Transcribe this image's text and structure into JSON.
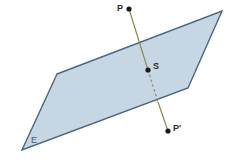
{
  "figure": {
    "width": 230,
    "height": 165,
    "background": "#ffffff"
  },
  "colors": {
    "plane_fill": "#c6d7e3",
    "plane_stroke": "#4a6680",
    "line_stroke": "#8a8a55",
    "point_fill": "#1a1a1a",
    "label_text": "#2b2b2b",
    "plane_label_text": "#4a5a68"
  },
  "plane": {
    "name": "E",
    "label": "E",
    "label_x": 31,
    "label_y": 136,
    "vertices": [
      {
        "x": 57,
        "y": 74
      },
      {
        "x": 222,
        "y": 11
      },
      {
        "x": 188,
        "y": 88
      },
      {
        "x": 22,
        "y": 150
      }
    ],
    "fill": "#c6d7e3",
    "stroke": "#4a6680",
    "stroke_width": 1.4
  },
  "points": [
    {
      "id": "P",
      "label": "P",
      "x": 129,
      "y": 9,
      "radius": 2.6,
      "label_x": 117,
      "label_y": 4,
      "label_position": "left"
    },
    {
      "id": "S",
      "label": "S",
      "x": 148,
      "y": 70,
      "radius": 2.6,
      "label_x": 153,
      "label_y": 62,
      "label_position": "right"
    },
    {
      "id": "P-prime",
      "label": "P'",
      "x": 168,
      "y": 131,
      "radius": 2.6,
      "label_x": 173,
      "label_y": 124,
      "label_position": "right"
    }
  ],
  "segments": [
    {
      "id": "segment-P-to-S",
      "style": "solid",
      "from": {
        "x": 129,
        "y": 9
      },
      "to": {
        "x": 148,
        "y": 70
      },
      "stroke": "#8a8a55",
      "stroke_width": 1.2
    },
    {
      "id": "segment-S-to-exit",
      "style": "dashed",
      "from": {
        "x": 148,
        "y": 70
      },
      "to": {
        "x": 158,
        "y": 102
      },
      "stroke": "#8a8a55",
      "stroke_width": 1.1,
      "dash_pattern": "2.5 2.5"
    },
    {
      "id": "segment-exit-to-P-prime",
      "style": "solid",
      "from": {
        "x": 158,
        "y": 102
      },
      "to": {
        "x": 168,
        "y": 131
      },
      "stroke": "#8a8a55",
      "stroke_width": 1.2
    }
  ]
}
